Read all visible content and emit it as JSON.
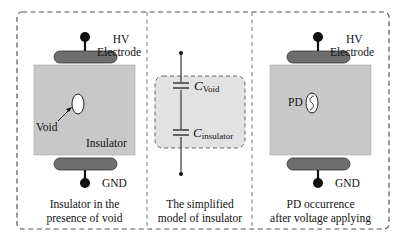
{
  "colors": {
    "insulator_fill": "#c8c8c8",
    "electrode_fill": "#6e6e6e",
    "dashed_border": "#555555",
    "model_box_fill": "#e2e2e2",
    "wire": "#111111"
  },
  "panels": [
    {
      "id": "left",
      "labels": {
        "hv_line1": "HV",
        "hv_line2": "Electrode",
        "void": "Void",
        "insulator": "Insulator",
        "gnd": "GND"
      },
      "caption_line1": "Insulator in the",
      "caption_line2": "presence of void"
    },
    {
      "id": "middle",
      "labels": {
        "c_void_main": "C",
        "c_void_sub": "Void",
        "c_ins_main": "C",
        "c_ins_sub": "insulator"
      },
      "caption_line1": "The simplified",
      "caption_line2": "model of insulator"
    },
    {
      "id": "right",
      "labels": {
        "hv_line1": "HV",
        "hv_line2": "Electrode",
        "pd": "PD",
        "gnd": "GND"
      },
      "caption_line1": "PD occurrence",
      "caption_line2": "after voltage applying"
    }
  ]
}
